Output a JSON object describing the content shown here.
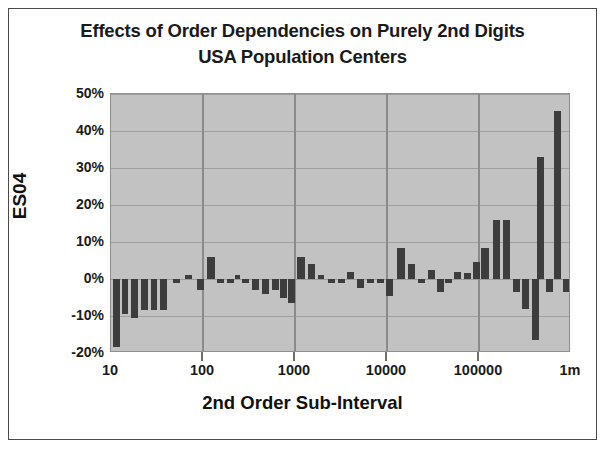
{
  "chart_data": {
    "type": "bar",
    "title": "Effects of Order Dependencies on Purely 2nd Digits\nUSA Population Centers",
    "title_line1": "Effects of Order Dependencies on Purely 2nd Digits",
    "title_line2": "USA Population Centers",
    "xlabel": "2nd Order Sub-Interval",
    "ylabel": "ES04",
    "ylim": [
      -20,
      50
    ],
    "ytick_values": [
      50,
      40,
      30,
      20,
      10,
      0,
      -10,
      -20
    ],
    "ytick_labels": [
      "50%",
      "40%",
      "30%",
      "20%",
      "10%",
      "0%",
      "-10%",
      "-20%"
    ],
    "xlim_log10": [
      1,
      6
    ],
    "xtick_values": [
      10,
      100,
      1000,
      10000,
      100000,
      1000000
    ],
    "xtick_labels": [
      "10",
      "100",
      "1000",
      "10000",
      "100000",
      "1m"
    ],
    "grid": true,
    "legend": false,
    "plot_bgcolor": "#c2c2c2",
    "bar_color": "#3d3d3d",
    "series_name": "ES04",
    "x_log": true,
    "x": [
      10.6,
      12.2,
      14.1,
      16.3,
      18.8,
      21.7,
      25.0,
      28.9,
      33.3,
      38.5,
      44.4,
      51.3,
      59.2,
      68.3,
      78.8,
      91.0,
      105,
      121,
      140,
      162,
      187,
      215,
      249,
      287,
      331,
      383,
      442,
      510,
      589,
      680,
      785,
      906,
      1046,
      1208,
      1394,
      1610,
      1858,
      2145,
      2477,
      2859,
      3300,
      3810,
      4398,
      5077,
      5861,
      6765,
      7809,
      9015,
      10407,
      12014,
      13870,
      16012,
      18486,
      21340,
      24635,
      28438,
      32828,
      37897,
      43747,
      50500,
      58295,
      67293,
      77681,
      89671,
      103518,
      119499,
      137946,
      159242,
      183826,
      212210,
      244980,
      282800,
      326500,
      376900,
      435100,
      502300,
      579900,
      669400,
      772700,
      892000
    ],
    "values": [
      -18.5,
      -9.5,
      -10.5,
      -8.5,
      -8.5,
      -8.0,
      -1.0,
      0.5,
      1.0,
      5.5,
      -2.5,
      -1.0,
      -1.0,
      -2.0,
      -1.0,
      -1.5,
      -1.0,
      -3.0,
      -1.0,
      -2.5,
      -2.5,
      -1.0,
      -1.0,
      -2.5,
      -3.0,
      -2.0,
      -4.5,
      -2.0,
      -6.0,
      5.5,
      3.5,
      0.5,
      -0.5,
      -1.5,
      -1.0,
      1.5,
      -2.5,
      -3.0,
      -1.0,
      -1.0,
      -3.5,
      8.5,
      3.5,
      -0.5,
      2.0,
      -2.0,
      -0.5,
      2.5,
      1.5,
      4.0,
      8.0,
      16.0,
      16.0,
      -3.0,
      -6.5,
      -16.5,
      33.0,
      -3.0,
      45.5,
      -3.0,
      -1.0,
      -1.0,
      -1.0,
      -1.0,
      -1.0,
      -1.0,
      -1.0,
      -1.0,
      -1.0,
      -1.0,
      -1.0,
      -1.0,
      -1.0,
      -1.0,
      -1.0,
      -1.0,
      -1.0,
      -1.0,
      -1.0,
      -1.0
    ],
    "bars": [
      {
        "x": 112,
        "w": 7,
        "v": -18.5
      },
      {
        "x": 121,
        "w": 6,
        "v": -9.5
      },
      {
        "x": 130,
        "w": 7,
        "v": -10.5
      },
      {
        "x": 140,
        "w": 7,
        "v": -8.5
      },
      {
        "x": 150,
        "w": 6,
        "v": -8.5
      },
      {
        "x": 159,
        "w": 7,
        "v": -8.5
      },
      {
        "x": 172,
        "w": 7,
        "v": -1.2
      },
      {
        "x": 184,
        "w": 7,
        "v": 1.2
      },
      {
        "x": 196,
        "w": 7,
        "v": -3.0
      },
      {
        "x": 206,
        "w": 8,
        "v": 6.0
      },
      {
        "x": 216,
        "w": 7,
        "v": -1.2
      },
      {
        "x": 226,
        "w": 7,
        "v": -1.2
      },
      {
        "x": 234,
        "w": 5,
        "v": 1.0
      },
      {
        "x": 241,
        "w": 7,
        "v": -1.2
      },
      {
        "x": 251,
        "w": 7,
        "v": -3.0
      },
      {
        "x": 261,
        "w": 7,
        "v": -4.0
      },
      {
        "x": 271,
        "w": 7,
        "v": -3.0
      },
      {
        "x": 279,
        "w": 7,
        "v": -5.0
      },
      {
        "x": 287,
        "w": 7,
        "v": -6.5
      },
      {
        "x": 296,
        "w": 8,
        "v": 6.0
      },
      {
        "x": 307,
        "w": 7,
        "v": 4.0
      },
      {
        "x": 317,
        "w": 6,
        "v": 1.0
      },
      {
        "x": 327,
        "w": 7,
        "v": -1.2
      },
      {
        "x": 337,
        "w": 7,
        "v": -1.2
      },
      {
        "x": 346,
        "w": 7,
        "v": 2.0
      },
      {
        "x": 356,
        "w": 7,
        "v": -2.5
      },
      {
        "x": 366,
        "w": 7,
        "v": -1.2
      },
      {
        "x": 376,
        "w": 7,
        "v": -1.2
      },
      {
        "x": 385,
        "w": 7,
        "v": -4.5
      },
      {
        "x": 396,
        "w": 8,
        "v": 8.5
      },
      {
        "x": 407,
        "w": 7,
        "v": 4.0
      },
      {
        "x": 417,
        "w": 7,
        "v": -1.2
      },
      {
        "x": 427,
        "w": 7,
        "v": 2.5
      },
      {
        "x": 436,
        "w": 7,
        "v": -3.5
      },
      {
        "x": 444,
        "w": 7,
        "v": -1.2
      },
      {
        "x": 453,
        "w": 7,
        "v": 2.0
      },
      {
        "x": 463,
        "w": 7,
        "v": 1.5
      },
      {
        "x": 472,
        "w": 7,
        "v": 4.5
      },
      {
        "x": 480,
        "w": 8,
        "v": 8.5
      },
      {
        "x": 492,
        "w": 7,
        "v": 16.0
      },
      {
        "x": 502,
        "w": 7,
        "v": 16.0
      },
      {
        "x": 512,
        "w": 7,
        "v": -3.5
      },
      {
        "x": 521,
        "w": 7,
        "v": -8.0
      },
      {
        "x": 531,
        "w": 7,
        "v": -16.5
      },
      {
        "x": 536,
        "w": 7,
        "v": 33.0
      },
      {
        "x": 545,
        "w": 7,
        "v": -3.5
      },
      {
        "x": 553,
        "w": 7,
        "v": 45.5
      },
      {
        "x": 562,
        "w": 7,
        "v": -3.5
      }
    ]
  }
}
